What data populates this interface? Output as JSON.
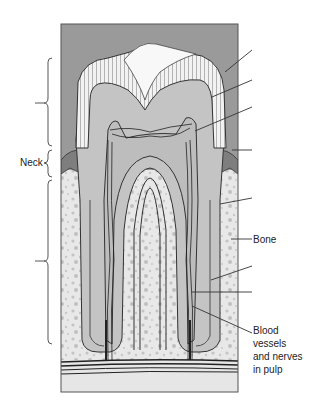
{
  "diagram": {
    "labels": {
      "neck": "Neck",
      "bone": "Bone",
      "blood_vessels": "Blood vessels and nerves in pulp"
    },
    "blood_vessels_lines": [
      "Blood",
      "vessels",
      "and nerves",
      "in pulp"
    ],
    "brackets": [
      {
        "name": "crown-bracket",
        "label": "",
        "y_start": 58,
        "y_end": 146
      },
      {
        "name": "neck-bracket",
        "label": "Neck",
        "y_start": 150,
        "y_end": 177
      },
      {
        "name": "root-bracket",
        "label": "",
        "y_start": 180,
        "y_end": 344
      }
    ],
    "leader_lines": [
      {
        "target": "enamel",
        "label": ""
      },
      {
        "target": "dentin",
        "label": ""
      },
      {
        "target": "pulp-cavity",
        "label": ""
      },
      {
        "target": "gum",
        "label": ""
      },
      {
        "target": "root-dentin",
        "label": ""
      },
      {
        "target": "bone",
        "label": "Bone"
      },
      {
        "target": "cementum",
        "label": ""
      },
      {
        "target": "root-canal",
        "label": ""
      },
      {
        "target": "blood-vessels-nerves",
        "label": "Blood vessels and nerves in pulp"
      }
    ],
    "colors": {
      "background_gray": "#9a9a9a",
      "tooth_gray": "#c4c4c4",
      "enamel_white": "#f4f4f4",
      "bone_light": "#e6e6e6",
      "bone_speckle": "#c2c2c2",
      "gum_dark": "#7e7e7e",
      "line": "#333333"
    }
  }
}
